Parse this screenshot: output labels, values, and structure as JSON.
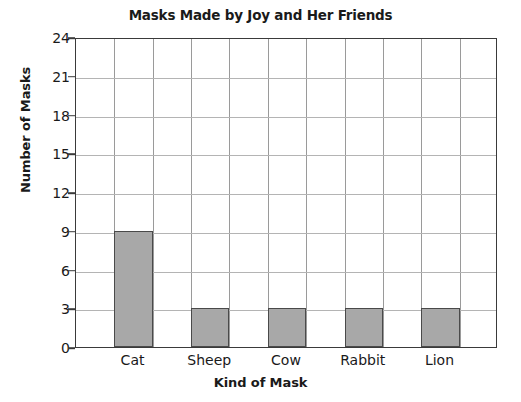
{
  "chart_data": {
    "type": "bar",
    "title": "Masks Made by Joy and Her Friends",
    "xlabel": "Kind of Mask",
    "ylabel": "Number of Masks",
    "categories": [
      "Cat",
      "Sheep",
      "Cow",
      "Rabbit",
      "Lion"
    ],
    "values": [
      9,
      3,
      3,
      3,
      3
    ],
    "ylim": [
      0,
      24
    ],
    "ytick_labels": [
      "0",
      "3",
      "6",
      "9",
      "12",
      "15",
      "18",
      "21",
      "24"
    ],
    "ytick_values": [
      0,
      3,
      6,
      9,
      12,
      15,
      18,
      21,
      24
    ],
    "grid": true,
    "legend": "none",
    "colors": {
      "bar_fill": "#a8a8a8",
      "bar_edge": "#4a4a4a",
      "frame": "#3a3a3a",
      "grid_line": "#b4b4b4",
      "text": "#1a1a1a",
      "background": "#ffffff"
    },
    "grid_columns": 11,
    "bar_columns": [
      2,
      4,
      6,
      8,
      10
    ]
  }
}
